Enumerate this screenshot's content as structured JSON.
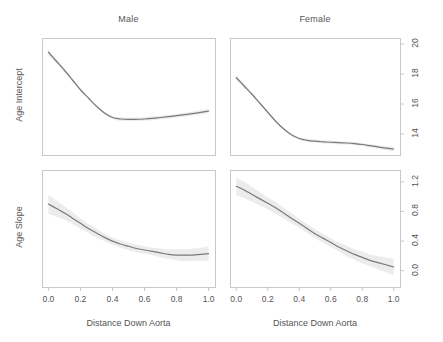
{
  "chart_data": {
    "type": "line",
    "title": "",
    "layout": "2x2 faceted panels (rows: Age Intercept, Age Slope; columns: Male, Female)",
    "grid": false,
    "legend": false,
    "column_titles": [
      "Male",
      "Female"
    ],
    "row_ylabels": [
      "Age Intercept",
      "Age Slope"
    ],
    "xlabel": "Distance Down Aorta",
    "x_ticks": [
      "0.0",
      "0.2",
      "0.4",
      "0.6",
      "0.8",
      "1.0"
    ],
    "x_tick_values": [
      0.0,
      0.2,
      0.4,
      0.6,
      0.8,
      1.0
    ],
    "xlim": [
      -0.04,
      1.04
    ],
    "y_axis_side": "right",
    "panels": [
      {
        "id": "male-age-intercept",
        "column": "Male",
        "row": "Age Intercept",
        "ylabel": "Age Intercept",
        "y_ticks": [
          "14",
          "16",
          "18",
          "20"
        ],
        "y_tick_values": [
          14,
          16,
          18,
          20
        ],
        "ylim": [
          12.6,
          20.4
        ],
        "has_confidence_band": true,
        "x": [
          0.0,
          0.05,
          0.1,
          0.15,
          0.2,
          0.25,
          0.3,
          0.35,
          0.4,
          0.45,
          0.5,
          0.55,
          0.6,
          0.65,
          0.7,
          0.75,
          0.8,
          0.85,
          0.9,
          0.95,
          1.0
        ],
        "y": [
          19.45,
          18.85,
          18.25,
          17.6,
          16.95,
          16.4,
          15.85,
          15.4,
          15.1,
          15.0,
          14.97,
          14.98,
          15.0,
          15.04,
          15.1,
          15.16,
          15.22,
          15.29,
          15.36,
          15.44,
          15.52
        ],
        "y_lower": [
          19.25,
          18.7,
          18.13,
          17.5,
          16.87,
          16.33,
          15.78,
          15.32,
          15.0,
          14.88,
          14.85,
          14.86,
          14.88,
          14.92,
          14.98,
          15.04,
          15.1,
          15.16,
          15.23,
          15.3,
          15.36
        ],
        "y_upper": [
          19.65,
          19.0,
          18.37,
          17.7,
          17.03,
          16.47,
          15.92,
          15.48,
          15.2,
          15.12,
          15.09,
          15.1,
          15.12,
          15.16,
          15.22,
          15.28,
          15.34,
          15.42,
          15.49,
          15.58,
          15.68
        ]
      },
      {
        "id": "female-age-intercept",
        "column": "Female",
        "row": "Age Intercept",
        "ylabel": "Age Intercept",
        "y_ticks": [
          "14",
          "16",
          "18",
          "20"
        ],
        "y_tick_values": [
          14,
          16,
          18,
          20
        ],
        "ylim": [
          12.6,
          20.4
        ],
        "has_confidence_band": true,
        "x": [
          0.0,
          0.05,
          0.1,
          0.15,
          0.2,
          0.25,
          0.3,
          0.35,
          0.4,
          0.45,
          0.5,
          0.55,
          0.6,
          0.65,
          0.7,
          0.75,
          0.8,
          0.85,
          0.9,
          0.95,
          1.0
        ],
        "y": [
          17.75,
          17.2,
          16.65,
          16.05,
          15.45,
          14.85,
          14.35,
          13.95,
          13.7,
          13.58,
          13.52,
          13.48,
          13.45,
          13.42,
          13.4,
          13.36,
          13.3,
          13.22,
          13.14,
          13.06,
          13.0
        ],
        "y_lower": [
          17.55,
          17.05,
          16.53,
          15.95,
          15.37,
          14.78,
          14.28,
          13.87,
          13.61,
          13.48,
          13.42,
          13.38,
          13.35,
          13.32,
          13.3,
          13.26,
          13.2,
          13.12,
          13.03,
          12.94,
          12.86
        ],
        "y_upper": [
          17.95,
          17.35,
          16.77,
          16.15,
          15.53,
          14.92,
          14.42,
          14.03,
          13.79,
          13.68,
          13.62,
          13.58,
          13.55,
          13.52,
          13.5,
          13.46,
          13.4,
          13.32,
          13.25,
          13.18,
          13.14
        ]
      },
      {
        "id": "male-age-slope",
        "column": "Male",
        "row": "Age Slope",
        "ylabel": "Age Slope",
        "y_ticks": [
          "0.0",
          "0.4",
          "0.8",
          "1.2"
        ],
        "y_tick_values": [
          0.0,
          0.4,
          0.8,
          1.2
        ],
        "ylim": [
          -0.22,
          1.36
        ],
        "has_confidence_band": true,
        "x": [
          0.0,
          0.05,
          0.1,
          0.15,
          0.2,
          0.25,
          0.3,
          0.35,
          0.4,
          0.45,
          0.5,
          0.55,
          0.6,
          0.65,
          0.7,
          0.75,
          0.8,
          0.85,
          0.9,
          0.95,
          1.0
        ],
        "y": [
          0.9,
          0.84,
          0.78,
          0.71,
          0.64,
          0.57,
          0.51,
          0.45,
          0.4,
          0.36,
          0.33,
          0.3,
          0.28,
          0.26,
          0.24,
          0.22,
          0.21,
          0.21,
          0.21,
          0.22,
          0.23
        ],
        "y_lower": [
          0.77,
          0.73,
          0.69,
          0.63,
          0.57,
          0.51,
          0.45,
          0.4,
          0.35,
          0.31,
          0.28,
          0.25,
          0.23,
          0.21,
          0.18,
          0.16,
          0.14,
          0.13,
          0.13,
          0.13,
          0.13
        ],
        "y_upper": [
          1.03,
          0.95,
          0.87,
          0.79,
          0.71,
          0.63,
          0.57,
          0.5,
          0.45,
          0.41,
          0.38,
          0.35,
          0.33,
          0.31,
          0.3,
          0.29,
          0.29,
          0.29,
          0.3,
          0.31,
          0.33
        ]
      },
      {
        "id": "female-age-slope",
        "column": "Female",
        "row": "Age Slope",
        "ylabel": "Age Slope",
        "y_ticks": [
          "0.0",
          "0.4",
          "0.8",
          "1.2"
        ],
        "y_tick_values": [
          0.0,
          0.4,
          0.8,
          1.2
        ],
        "ylim": [
          -0.22,
          1.36
        ],
        "has_confidence_band": true,
        "x": [
          0.0,
          0.05,
          0.1,
          0.15,
          0.2,
          0.25,
          0.3,
          0.35,
          0.4,
          0.45,
          0.5,
          0.55,
          0.6,
          0.65,
          0.7,
          0.75,
          0.8,
          0.85,
          0.9,
          0.95,
          1.0
        ],
        "y": [
          1.14,
          1.09,
          1.03,
          0.97,
          0.91,
          0.85,
          0.78,
          0.71,
          0.64,
          0.57,
          0.5,
          0.44,
          0.38,
          0.32,
          0.27,
          0.22,
          0.18,
          0.14,
          0.11,
          0.08,
          0.05
        ],
        "y_lower": [
          1.02,
          0.98,
          0.93,
          0.88,
          0.83,
          0.77,
          0.71,
          0.64,
          0.58,
          0.51,
          0.44,
          0.38,
          0.32,
          0.26,
          0.2,
          0.15,
          0.1,
          0.06,
          0.02,
          -0.02,
          -0.06
        ],
        "y_upper": [
          1.26,
          1.2,
          1.13,
          1.06,
          0.99,
          0.93,
          0.85,
          0.78,
          0.7,
          0.63,
          0.56,
          0.5,
          0.44,
          0.38,
          0.34,
          0.29,
          0.26,
          0.22,
          0.2,
          0.18,
          0.16
        ]
      }
    ],
    "colors": {
      "curve": "#7a7a7a",
      "band": "#e9e9e9",
      "frame": "#c8c8c8",
      "text": "#555555",
      "background": "#ffffff"
    }
  },
  "geometry": {
    "panels": [
      {
        "id": "male-age-intercept",
        "left": 42,
        "top": 38,
        "width": 173,
        "height": 117
      },
      {
        "id": "female-age-intercept",
        "left": 230,
        "top": 38,
        "width": 170,
        "height": 117
      },
      {
        "id": "male-age-slope",
        "left": 42,
        "top": 170,
        "width": 173,
        "height": 117
      },
      {
        "id": "female-age-slope",
        "left": 230,
        "top": 170,
        "width": 170,
        "height": 117
      }
    ]
  }
}
